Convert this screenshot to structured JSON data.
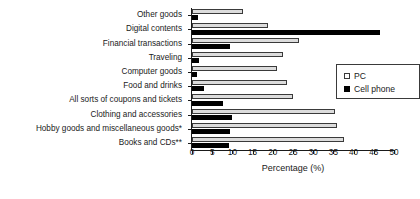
{
  "chart_data": {
    "type": "bar",
    "orientation": "horizontal",
    "title": "",
    "xlabel": "Percentage (%)",
    "ylabel": "",
    "xlim": [
      0,
      50
    ],
    "xticks": [
      0,
      5,
      10,
      15,
      20,
      25,
      30,
      35,
      40,
      45,
      50
    ],
    "grid": false,
    "legend_position": "center-right",
    "categories": [
      "Other goods",
      "Digital contents",
      "Financial transactions",
      "Traveling",
      "Computer goods",
      "Food and drinks",
      "All sorts of coupons and tickets",
      "Clothing and accessories",
      "Hobby goods and miscellaneous goods*",
      "Books and CDs**"
    ],
    "series": [
      {
        "name": "PC",
        "color": "#dcdcdc",
        "values": [
          12.5,
          18.8,
          26.5,
          22.5,
          21.0,
          23.5,
          25.0,
          35.5,
          36.0,
          37.5
        ]
      },
      {
        "name": "Cell phone",
        "color": "#000000",
        "values": [
          1.6,
          46.5,
          9.5,
          1.7,
          1.2,
          3.0,
          7.7,
          9.8,
          9.5,
          9.2
        ]
      }
    ]
  },
  "legend": {
    "entries": [
      {
        "label": "PC",
        "swatch": "open-square-icon"
      },
      {
        "label": "Cell phone",
        "swatch": "filled-square-icon"
      }
    ]
  },
  "axis": {
    "x_title": "Percentage (%)"
  }
}
